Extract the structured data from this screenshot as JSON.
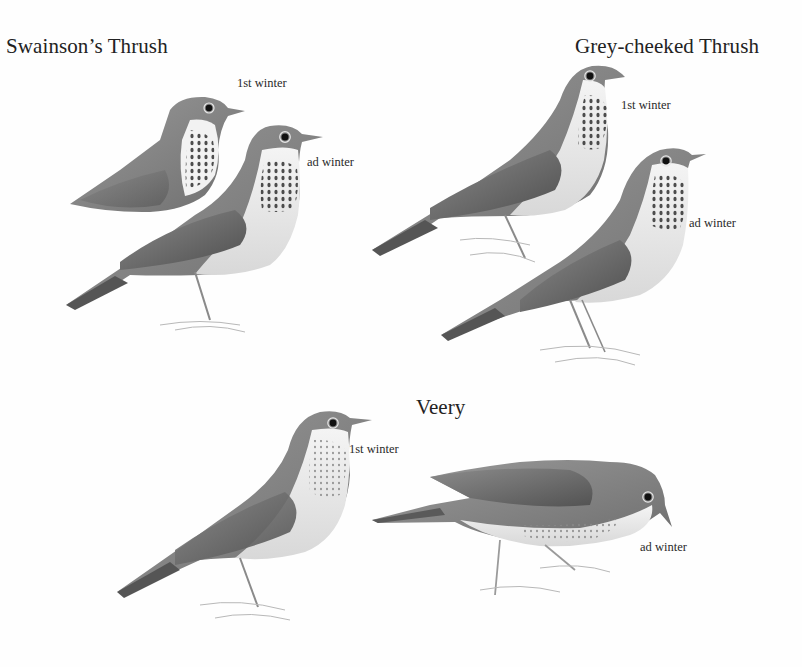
{
  "plate": {
    "background": "#fefefe",
    "ink_color": "#222222"
  },
  "species": [
    {
      "name": "Swainson’s Thrush",
      "figures": [
        {
          "label": "1st winter"
        },
        {
          "label": "ad winter"
        }
      ]
    },
    {
      "name": "Grey-cheeked Thrush",
      "figures": [
        {
          "label": "1st winter"
        },
        {
          "label": "ad winter"
        }
      ]
    },
    {
      "name": "Veery",
      "figures": [
        {
          "label": "1st winter"
        },
        {
          "label": "ad winter"
        }
      ]
    }
  ]
}
